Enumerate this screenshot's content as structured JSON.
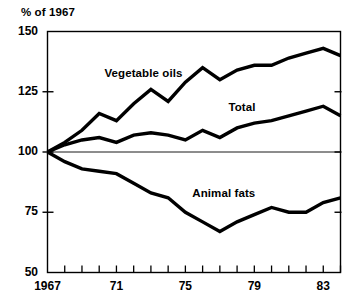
{
  "chart_data": {
    "type": "line",
    "title": "",
    "subtitle": "",
    "ylabel": "% of 1967",
    "xlabel": "",
    "ylim": [
      50,
      150
    ],
    "xlim": [
      1967,
      1984
    ],
    "ytick_values": [
      150,
      125,
      100,
      75,
      50
    ],
    "ytick_labels": [
      "150",
      "125",
      "100",
      "75",
      "50"
    ],
    "xtick_values": [
      1967,
      1968,
      1969,
      1970,
      1971,
      1972,
      1973,
      1974,
      1975,
      1976,
      1977,
      1978,
      1979,
      1980,
      1981,
      1982,
      1983,
      1984
    ],
    "xtick_labeled": [
      {
        "value": 1967,
        "label": "1967"
      },
      {
        "value": 1971,
        "label": "71"
      },
      {
        "value": 1975,
        "label": "75"
      },
      {
        "value": 1979,
        "label": "79"
      },
      {
        "value": 1983,
        "label": "83"
      }
    ],
    "grid": false,
    "reference_line": 100,
    "legend_position": "inline-annotations",
    "x": [
      1967,
      1968,
      1969,
      1970,
      1971,
      1972,
      1973,
      1974,
      1975,
      1976,
      1977,
      1978,
      1979,
      1980,
      1981,
      1982,
      1983,
      1984
    ],
    "series": [
      {
        "name": "Vegetable oils",
        "label_x": 1970.3,
        "label_y": 132,
        "values": [
          100,
          104,
          109,
          116,
          113,
          120,
          126,
          121,
          129,
          135,
          130,
          134,
          136,
          136,
          139,
          141,
          143,
          140
        ]
      },
      {
        "name": "Total",
        "label_x": 1977.5,
        "label_y": 118,
        "values": [
          100,
          103,
          105,
          106,
          104,
          107,
          108,
          107,
          105,
          109,
          106,
          110,
          112,
          113,
          115,
          117,
          119,
          115
        ]
      },
      {
        "name": "Animal fats",
        "label_x": 1975.4,
        "label_y": 82,
        "values": [
          100,
          96,
          93,
          92,
          91,
          87,
          83,
          81,
          75,
          71,
          67,
          71,
          74,
          77,
          75,
          75,
          79,
          81
        ]
      }
    ]
  }
}
